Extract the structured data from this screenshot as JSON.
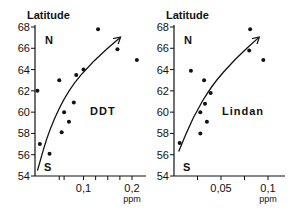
{
  "chart_data": [
    {
      "type": "scatter",
      "title": "DDT",
      "ylabel": "Latitude",
      "xlabel": "ppm",
      "ylim": [
        54,
        68
      ],
      "xlim": [
        0,
        0.22
      ],
      "yticks": [
        54,
        56,
        58,
        60,
        62,
        64,
        66,
        68
      ],
      "xticks_labeled": [
        {
          "v": 0.1,
          "label": "0,1"
        },
        {
          "v": 0.2,
          "label": "0,2"
        }
      ],
      "xticks_minor": [
        0.05,
        0.06,
        0.125,
        0.15,
        0.175
      ],
      "annotations": {
        "north": "N",
        "south": "S",
        "label": "DDT"
      },
      "grid": false,
      "points": [
        {
          "x": 0.005,
          "y": 62.0
        },
        {
          "x": 0.01,
          "y": 57.0
        },
        {
          "x": 0.03,
          "y": 56.1
        },
        {
          "x": 0.05,
          "y": 63.0
        },
        {
          "x": 0.055,
          "y": 58.1
        },
        {
          "x": 0.06,
          "y": 60.0
        },
        {
          "x": 0.07,
          "y": 59.1
        },
        {
          "x": 0.08,
          "y": 60.9
        },
        {
          "x": 0.085,
          "y": 63.5
        },
        {
          "x": 0.1,
          "y": 64.0
        },
        {
          "x": 0.13,
          "y": 67.8
        },
        {
          "x": 0.17,
          "y": 65.9
        },
        {
          "x": 0.21,
          "y": 64.9
        }
      ],
      "trend_arrow": [
        [
          0.005,
          54.5
        ],
        [
          0.03,
          58.5
        ],
        [
          0.07,
          62.2
        ],
        [
          0.12,
          64.8
        ],
        [
          0.175,
          67.0
        ]
      ]
    },
    {
      "type": "scatter",
      "title": "Lindan",
      "ylabel": "Latitude",
      "xlabel": "ppm",
      "ylim": [
        54,
        68
      ],
      "xlim": [
        0,
        0.11
      ],
      "yticks": [
        54,
        56,
        58,
        60,
        62,
        64,
        66,
        68
      ],
      "xticks_labeled": [
        {
          "v": 0.05,
          "label": "0,05"
        },
        {
          "v": 0.1,
          "label": "0,1"
        }
      ],
      "xticks_minor": [
        0.025,
        0.075
      ],
      "annotations": {
        "north": "N",
        "south": "S",
        "label": "Lindan"
      },
      "grid": false,
      "points": [
        {
          "x": 0.006,
          "y": 57.1
        },
        {
          "x": 0.018,
          "y": 63.9
        },
        {
          "x": 0.028,
          "y": 58.0
        },
        {
          "x": 0.028,
          "y": 60.0
        },
        {
          "x": 0.032,
          "y": 63.0
        },
        {
          "x": 0.033,
          "y": 60.8
        },
        {
          "x": 0.035,
          "y": 59.1
        },
        {
          "x": 0.039,
          "y": 61.8
        },
        {
          "x": 0.08,
          "y": 65.8
        },
        {
          "x": 0.081,
          "y": 67.8
        },
        {
          "x": 0.095,
          "y": 64.9
        }
      ],
      "trend_arrow": [
        [
          0.005,
          56.3
        ],
        [
          0.02,
          59.5
        ],
        [
          0.04,
          62.5
        ],
        [
          0.065,
          65.0
        ],
        [
          0.09,
          67.0
        ]
      ]
    }
  ],
  "layout": {
    "charts": [
      {
        "x0": 35,
        "xscale": 485,
        "ytop": 27,
        "ybottom": 176,
        "xend": 146
      },
      {
        "x0": 174,
        "xscale": 940,
        "ytop": 27,
        "ybottom": 176,
        "xend": 285
      }
    ]
  }
}
